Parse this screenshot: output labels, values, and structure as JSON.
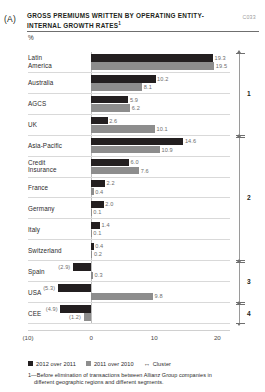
{
  "panel": {
    "letter": "(A)"
  },
  "header": {
    "title": "GROSS PREMIUMS WRITTEN BY OPERATING ENTITY-INTERNAL GROWTH RATES",
    "title_sup": "1",
    "code": "C033",
    "unit": "%"
  },
  "legend": {
    "series_2012": "2012 over 2011",
    "series_2011": "2011 over 2010",
    "cluster_marker": "↔",
    "cluster_label": "Cluster"
  },
  "footnote": {
    "line1": "1—Before elimination of transactions between Allianz Group companies in",
    "line2": "different geographic regions and different segments."
  },
  "clusters": [
    {
      "id": "1",
      "label": "1",
      "start_index": 0,
      "end_index": 3
    },
    {
      "id": "2",
      "label": "2",
      "start_index": 4,
      "end_index": 9
    },
    {
      "id": "3",
      "label": "3",
      "start_index": 10,
      "end_index": 11
    },
    {
      "id": "4",
      "label": "4",
      "start_index": 12,
      "end_index": 12
    }
  ],
  "colors": {
    "series_2012": "#231f20",
    "series_2011": "#8d8d8d",
    "gridline": "#d9d9d9",
    "axis": "#d0d0d0",
    "value_label": "#6d6d6d"
  },
  "chart_data": {
    "type": "bar",
    "orientation": "horizontal",
    "title": "GROSS PREMIUMS WRITTEN BY OPERATING ENTITY-INTERNAL GROWTH RATES",
    "xlabel": "",
    "ylabel": "",
    "unit": "%",
    "xlim": [
      -10,
      22
    ],
    "xticks": [
      -10,
      0,
      10,
      20
    ],
    "xticklabels": [
      "(10)",
      "0",
      "10",
      "20"
    ],
    "grid": true,
    "legend_position": "bottom-left",
    "categories": [
      "Latin America",
      "Australia",
      "AGCS",
      "UK",
      "Asia-Pacific",
      "Credit Insurance",
      "France",
      "Germany",
      "Italy",
      "Switzerland",
      "Spain",
      "USA",
      "CEE"
    ],
    "series": [
      {
        "name": "2012 over 2011",
        "color": "#231f20",
        "values": [
          19.3,
          10.2,
          5.9,
          2.6,
          14.6,
          6.0,
          2.2,
          2.0,
          1.4,
          0.4,
          -2.9,
          -5.3,
          -4.9
        ],
        "labels": [
          "19.3",
          "10.2",
          "5.9",
          "2.6",
          "14.6",
          "6.0",
          "2.2",
          "2.0",
          "1.4",
          "0.4",
          "(2.9)",
          "(5.3)",
          "(4.9)"
        ]
      },
      {
        "name": "2011 over 2010",
        "color": "#8d8d8d",
        "values": [
          19.5,
          8.1,
          6.2,
          10.1,
          10.9,
          7.6,
          0.4,
          0.1,
          0.1,
          0.2,
          0.3,
          9.8,
          -1.2
        ],
        "labels": [
          "19.5",
          "8.1",
          "6.2",
          "10.1",
          "10.9",
          "7.6",
          "0.4",
          "0.1",
          "0.1",
          "0.2",
          "0.3",
          "9.8",
          "(1.2)"
        ]
      }
    ]
  }
}
